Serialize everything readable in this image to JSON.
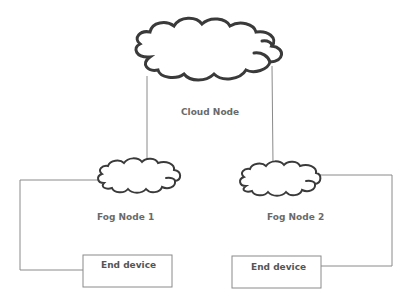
{
  "diagram": {
    "type": "fog computing topology",
    "nodes": {
      "cloud": {
        "label": "Cloud Node",
        "shape": "cloud"
      },
      "fog1": {
        "label": "Fog Node 1",
        "shape": "cloud"
      },
      "fog2": {
        "label": "Fog Node 2",
        "shape": "cloud"
      },
      "device1": {
        "label": "End device",
        "shape": "rectangle"
      },
      "device2": {
        "label": "End device",
        "shape": "rectangle"
      }
    },
    "edges": [
      {
        "from": "cloud",
        "to": "fog1"
      },
      {
        "from": "cloud",
        "to": "fog2"
      },
      {
        "from": "fog1",
        "to": "device1"
      },
      {
        "from": "fog2",
        "to": "device2"
      }
    ],
    "colors": {
      "stroke": "#3a3a3a",
      "line": "#8a8a8a",
      "text": "#6a6a6a"
    }
  }
}
